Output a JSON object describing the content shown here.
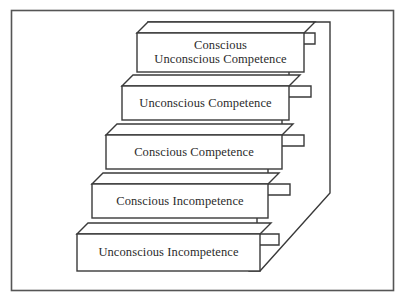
{
  "diagram": {
    "type": "isometric-staircase",
    "title_visible": false,
    "frame": {
      "x": 11,
      "y": 10,
      "width": 383,
      "height": 281,
      "stroke": "#555555",
      "fill": "#ffffff"
    },
    "style": {
      "face_fill": "#ffffff",
      "stroke": "#3a3a3a",
      "text_color": "#2b2b2b",
      "depth_dx": 11,
      "depth_dy": -11
    },
    "steps": [
      {
        "index": 1,
        "level": "top",
        "label": "Conscious\nUnconscious Competence",
        "front": {
          "x": 137,
          "y": 33,
          "width": 167,
          "height": 39
        },
        "label_center_x": 220,
        "label_center_y": 52
      },
      {
        "index": 2,
        "level": "fourth",
        "label": "Unconscious Competence",
        "front": {
          "x": 122,
          "y": 86,
          "width": 167,
          "height": 34
        },
        "label_center_x": 205,
        "label_center_y": 103
      },
      {
        "index": 3,
        "level": "third",
        "label": "Conscious Competence",
        "front": {
          "x": 106,
          "y": 135,
          "width": 176,
          "height": 34
        },
        "label_center_x": 194,
        "label_center_y": 152
      },
      {
        "index": 4,
        "level": "second",
        "label": "Conscious Incompetence",
        "front": {
          "x": 92,
          "y": 184,
          "width": 176,
          "height": 34
        },
        "label_center_x": 180,
        "label_center_y": 201
      },
      {
        "index": 5,
        "level": "bottom",
        "label": "Unconscious Incompetence",
        "front": {
          "x": 77,
          "y": 234,
          "width": 183,
          "height": 37
        },
        "label_center_x": 168,
        "label_center_y": 253
      }
    ],
    "side_profile": {
      "back_edge_x": 330,
      "back_edge_top_y": 22,
      "back_edge_bottom_y": 193,
      "base_diagonal_end_x": 260,
      "base_diagonal_end_y": 271
    }
  }
}
